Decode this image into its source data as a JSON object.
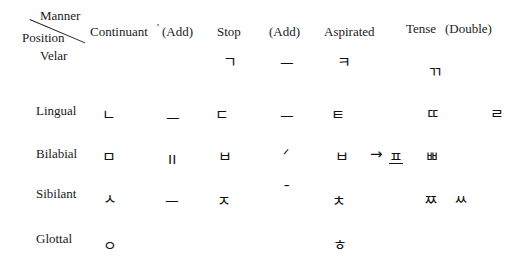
{
  "header": {
    "corner_top": "Manner",
    "corner_bottom": "Position",
    "columns": [
      "Continuant",
      "(Add)",
      "Stop",
      "(Add)",
      "Aspirated",
      "Tense",
      "(Double)"
    ],
    "tick_mark": "'"
  },
  "rows": [
    {
      "label": "Velar",
      "continuant": "",
      "add1": "",
      "stop": "ㄱ",
      "add2": "ㅡ",
      "aspirated": "ㅋ",
      "tense": "ㄲ",
      "extra": ""
    },
    {
      "label": "Lingual",
      "continuant": "ㄴ",
      "add1": "ㅡ",
      "stop": "ㄷ",
      "add2": "ㅡ",
      "aspirated": "ㅌ",
      "tense": "ㄸ",
      "extra": "ㄹ"
    },
    {
      "label": "Bilabial",
      "continuant": "ㅁ",
      "add1": "ıı",
      "stop": "ㅂ",
      "add2": "ᐟ",
      "aspirated": "ㅂ",
      "arrow": "→",
      "derived": "ㅍ",
      "tense": "ㅃ"
    },
    {
      "label": "Sibilant",
      "continuant": "ㅅ",
      "add1": "ㅡ",
      "stop": "ㅈ",
      "add2": "ˉ",
      "aspirated": "ㅊ",
      "tense": "ㅉ",
      "tense2": "ㅆ"
    },
    {
      "label": "Glottal",
      "continuant": "ㅇ",
      "aspirated": "ㅎ"
    }
  ]
}
